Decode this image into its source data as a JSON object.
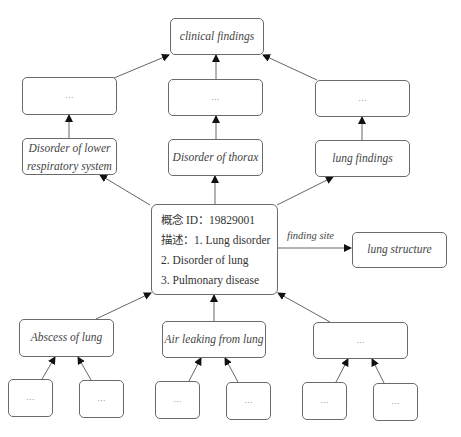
{
  "diagram": {
    "root": {
      "label": "clinical findings"
    },
    "level2": [
      {
        "label": "..."
      },
      {
        "label": "..."
      },
      {
        "label": "..."
      }
    ],
    "parents": [
      {
        "label_line1": "Disorder of lower",
        "label_line2": "respiratory system"
      },
      {
        "label": "Disorder of thorax"
      },
      {
        "label": "lung findings"
      }
    ],
    "concept": {
      "id_line": "概念 ID：19829001",
      "desc_line1": "描述：1. Lung disorder",
      "desc_line2": "2. Disorder of lung",
      "desc_line3": "3. Pulmonary disease"
    },
    "relation": {
      "label": "finding site",
      "target": "lung structure"
    },
    "children": [
      {
        "label": "Abscess of lung"
      },
      {
        "label": "Air leaking from lung"
      },
      {
        "label": "..."
      }
    ],
    "grandchildren": [
      {
        "label": "..."
      },
      {
        "label": "..."
      },
      {
        "label": "..."
      },
      {
        "label": "..."
      },
      {
        "label": "..."
      },
      {
        "label": "..."
      }
    ]
  }
}
